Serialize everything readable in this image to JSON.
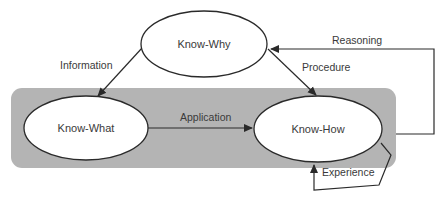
{
  "diagram": {
    "colors": {
      "group_fill": "#b4b4b4",
      "node_fill": "#ffffff",
      "stroke": "#2a2a2a",
      "text": "#3a3a3a"
    },
    "nodes": {
      "know_why": {
        "label": "Know-Why"
      },
      "know_what": {
        "label": "Know-What"
      },
      "know_how": {
        "label": "Know-How"
      }
    },
    "edges": {
      "information": {
        "label": "Information",
        "from": "Know-Why",
        "to": "Know-What"
      },
      "procedure": {
        "label": "Procedure",
        "from": "Know-Why",
        "to": "Know-How"
      },
      "application": {
        "label": "Application",
        "from": "Know-What",
        "to": "Know-How"
      },
      "reasoning": {
        "label": "Reasoning",
        "from": "Know-How",
        "to": "Know-Why"
      },
      "experience": {
        "label": "Experience",
        "from": "Know-How",
        "to": "Know-How"
      }
    }
  }
}
